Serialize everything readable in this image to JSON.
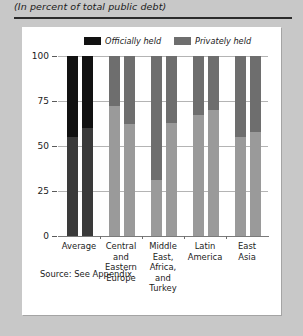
{
  "figure": {
    "subtitle": "(In percent of total public debt)",
    "source_note": "Source: See Appendix."
  },
  "legend": {
    "items": [
      {
        "label": "Officially held",
        "color": "#111111",
        "name": "officially-held"
      },
      {
        "label": "Privately held",
        "color": "#6e6e6e",
        "name": "privately-held"
      }
    ]
  },
  "colors": {
    "officially_held_average": "#111111",
    "privately_held_average": "#3a3a3a",
    "officially_held_region": "#6e6e6e",
    "privately_held_region": "#9a9a9a",
    "panel_background": "#ffffff",
    "figure_background": "#c8c8c8",
    "gridline": "#b4b4b4",
    "axis": "#7a7a7a",
    "text": "#1b1b1b"
  },
  "chart_data": {
    "type": "bar",
    "title": "",
    "subtitle": "(In percent of total public debt)",
    "xlabel": "",
    "ylabel": "",
    "ylim": [
      0,
      100
    ],
    "yticks": [
      0,
      25,
      50,
      75,
      100
    ],
    "ytick_labels": [
      "0",
      "25",
      "50",
      "75",
      "100"
    ],
    "grid": true,
    "stacked": true,
    "legend_position": "top",
    "legend_entries": [
      "Officially held",
      "Privately held"
    ],
    "categories": [
      "Average",
      "Central\nand\nEastern\nEurope",
      "Middle\nEast,\nAfrica,\nand\nTurkey",
      "Latin\nAmerica",
      "East\nAsia"
    ],
    "bars_per_category": 2,
    "series": [
      {
        "name": "Officially held",
        "values": [
          [
            45,
            40
          ],
          [
            28,
            38
          ],
          [
            69,
            37
          ],
          [
            33,
            30
          ],
          [
            45,
            42
          ]
        ]
      },
      {
        "name": "Privately held",
        "values": [
          [
            55,
            60
          ],
          [
            72,
            62
          ],
          [
            31,
            63
          ],
          [
            67,
            70
          ],
          [
            55,
            58
          ]
        ]
      }
    ],
    "groups": [
      {
        "category": "Average",
        "label_lines": [
          "Average"
        ],
        "bars": [
          {
            "privately_held": 55,
            "officially_held": 45,
            "dark": true
          },
          {
            "privately_held": 60,
            "officially_held": 40,
            "dark": true
          }
        ]
      },
      {
        "category": "Central and Eastern Europe",
        "label_lines": [
          "Central",
          "and",
          "Eastern",
          "Europe"
        ],
        "bars": [
          {
            "privately_held": 72,
            "officially_held": 28,
            "dark": false
          },
          {
            "privately_held": 62,
            "officially_held": 38,
            "dark": false
          }
        ]
      },
      {
        "category": "Middle East, Africa, and Turkey",
        "label_lines": [
          "Middle",
          "East,",
          "Africa,",
          "and",
          "Turkey"
        ],
        "bars": [
          {
            "privately_held": 31,
            "officially_held": 69,
            "dark": false
          },
          {
            "privately_held": 63,
            "officially_held": 37,
            "dark": false
          }
        ]
      },
      {
        "category": "Latin America",
        "label_lines": [
          "Latin",
          "America"
        ],
        "bars": [
          {
            "privately_held": 67,
            "officially_held": 33,
            "dark": false
          },
          {
            "privately_held": 70,
            "officially_held": 30,
            "dark": false
          }
        ]
      },
      {
        "category": "East Asia",
        "label_lines": [
          "East",
          "Asia"
        ],
        "bars": [
          {
            "privately_held": 55,
            "officially_held": 45,
            "dark": false
          },
          {
            "privately_held": 58,
            "officially_held": 42,
            "dark": false
          }
        ]
      }
    ]
  }
}
